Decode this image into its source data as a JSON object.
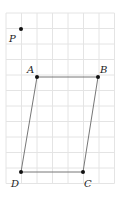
{
  "diagram": {
    "type": "parallelogram-on-grid",
    "grid": {
      "x0": 6,
      "y0": 13,
      "cell": 15.5,
      "cols": 7,
      "rows": 11,
      "color": "#e4e4e4"
    },
    "points": [
      {
        "id": "P",
        "label": "P",
        "x": 21,
        "y": 29,
        "lx": 9,
        "ly": 42
      },
      {
        "id": "A",
        "label": "A",
        "x": 37,
        "y": 77,
        "lx": 27,
        "ly": 73
      },
      {
        "id": "B",
        "label": "B",
        "x": 98,
        "y": 77,
        "lx": 100,
        "ly": 73
      },
      {
        "id": "C",
        "label": "C",
        "x": 83,
        "y": 172,
        "lx": 84,
        "ly": 187
      },
      {
        "id": "D",
        "label": "D",
        "x": 21,
        "y": 172,
        "lx": 11,
        "ly": 187
      }
    ],
    "segments": [
      [
        "A",
        "B"
      ],
      [
        "B",
        "C"
      ],
      [
        "C",
        "D"
      ],
      [
        "D",
        "A"
      ]
    ],
    "colors": {
      "line": "#777777",
      "point": "#111111"
    }
  }
}
